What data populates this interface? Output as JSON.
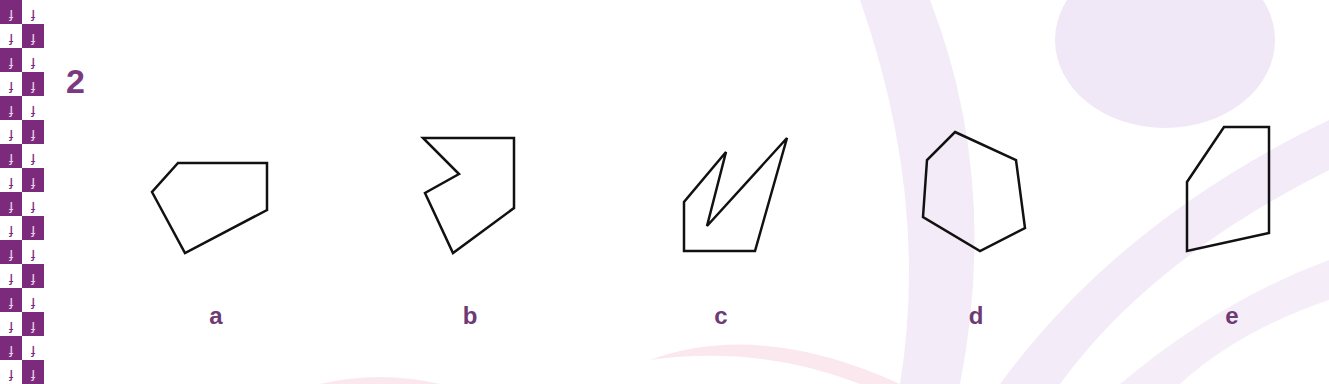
{
  "question": {
    "number": "2"
  },
  "border": {
    "figure_glyph": "running-figure",
    "dark_color": "#7b2a7c",
    "light_color": "#ffffff",
    "rows": 16
  },
  "options": [
    {
      "label": "a",
      "center_x": 216,
      "points": "178,163 267,163 267,210 185,253 152,192"
    },
    {
      "label": "b",
      "center_x": 470,
      "points": "423,138 514,138 514,208 453,253 425,193 459,174"
    },
    {
      "label": "c",
      "center_x": 721,
      "points": "684,251 684,202 726,152 707,226 787,138 755,251"
    },
    {
      "label": "d",
      "center_x": 976,
      "points": "955,132 1016,160 1025,228 980,251 923,217 927,160"
    },
    {
      "label": "e",
      "center_x": 1232,
      "points": "1224,127 1269,127 1269,233 1187,251 1187,182"
    }
  ],
  "colors": {
    "accent": "#7b3a80",
    "label": "#6e3a73",
    "stroke": "#111111",
    "watermark_lavender": "#f1e8f7",
    "watermark_pink": "#fbe8ee"
  }
}
